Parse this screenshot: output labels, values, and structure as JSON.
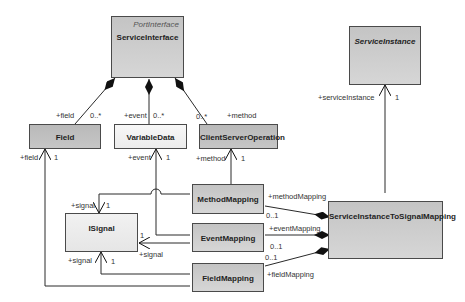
{
  "classes": {
    "service_interface": {
      "name": "ServiceInterface",
      "stereotype": "PortInterface"
    },
    "field": {
      "name": "Field"
    },
    "variable_data": {
      "name": "VariableData"
    },
    "client_server_operation": {
      "name": "ClientServerOperation"
    },
    "service_instance": {
      "name": "ServiceInstance"
    },
    "method_mapping": {
      "name": "MethodMapping"
    },
    "isignal": {
      "name": "ISignal"
    },
    "event_mapping": {
      "name": "EventMapping"
    },
    "field_mapping": {
      "name": "FieldMapping"
    },
    "si_to_signal_mapping": {
      "name": "ServiceInstanceToSignalMapping"
    }
  },
  "labels": {
    "field_role": "+field",
    "field_mult": "0..*",
    "event_role": "+event",
    "event_mult": "0..*",
    "method_mult": "0..*",
    "method_role": "+method",
    "field_ref_role": "+field",
    "field_ref_mult": "1",
    "event_ref_role": "+event",
    "event_ref_mult": "1",
    "method_ref_role": "+method",
    "method_ref_mult": "1",
    "service_instance_role": "+serviceInstance",
    "service_instance_mult": "1",
    "signal_top_role": "+signal",
    "signal_top_mult": "1",
    "signal_right_mult": "1",
    "signal_right_role": "+signal",
    "signal_bottom_role": "+signal",
    "signal_bottom_mult": "1",
    "method_mapping_role": "+methodMapping",
    "method_mapping_mult": "0..1",
    "event_mapping_role": "+eventMapping",
    "event_mapping_mult": "0..1",
    "field_mapping_mult": "0..1",
    "field_mapping_role": "+fieldMapping"
  },
  "colors": {
    "line": "#2a2a2a",
    "class_fill": "#c9c9c9",
    "class_fill_light": "#eeeeee",
    "class_border": "#4a4a4a"
  }
}
